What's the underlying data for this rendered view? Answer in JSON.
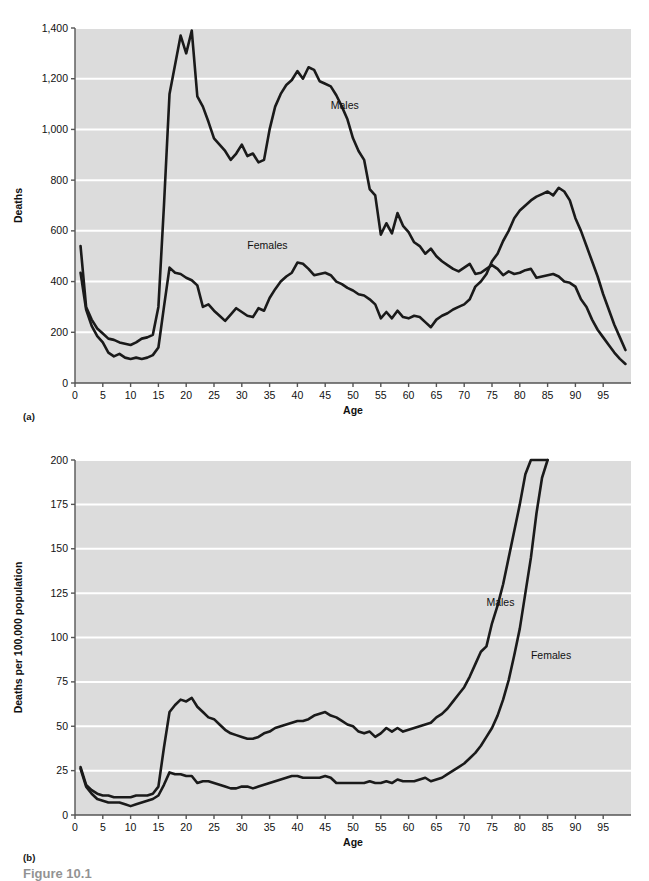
{
  "figure": {
    "caption": "Figure 10.1",
    "panel_a_tag": "(a)",
    "panel_b_tag": "(b)"
  },
  "style": {
    "plot_background": "#dcdcdc",
    "gridline_color": "#ffffff",
    "line_color": "#1a1a1a",
    "axis_color": "#555555",
    "page_background": "#ffffff"
  },
  "chart_data": [
    {
      "type": "line",
      "id": "panel-a",
      "title": "",
      "xlabel": "Age",
      "ylabel": "Deaths",
      "xlim": [
        0,
        100
      ],
      "ylim": [
        0,
        1400
      ],
      "grid": true,
      "legend_position": "inline-annotation",
      "xticks": [
        0,
        5,
        10,
        15,
        20,
        25,
        30,
        35,
        40,
        45,
        50,
        55,
        60,
        65,
        70,
        75,
        80,
        85,
        90,
        95
      ],
      "xtick_labels": [
        "0",
        "5",
        "10",
        "15",
        "20",
        "25",
        "30",
        "35",
        "40",
        "45",
        "50",
        "55",
        "60",
        "65",
        "70",
        "75",
        "80",
        "85",
        "90",
        "95"
      ],
      "yticks": [
        0,
        200,
        400,
        600,
        800,
        1000,
        1200,
        1400
      ],
      "ytick_labels": [
        "0",
        "200",
        "400",
        "600",
        "800",
        "1,000",
        "1,200",
        "1,400"
      ],
      "annotations": [
        {
          "text": "Males",
          "x": 46,
          "y": 1080
        },
        {
          "text": "Females",
          "x": 31,
          "y": 530
        }
      ],
      "x": [
        1,
        2,
        3,
        4,
        5,
        6,
        7,
        8,
        9,
        10,
        11,
        12,
        13,
        14,
        15,
        16,
        17,
        18,
        19,
        20,
        21,
        22,
        23,
        24,
        25,
        26,
        27,
        28,
        29,
        30,
        31,
        32,
        33,
        34,
        35,
        36,
        37,
        38,
        39,
        40,
        41,
        42,
        43,
        44,
        45,
        46,
        47,
        48,
        49,
        50,
        51,
        52,
        53,
        54,
        55,
        56,
        57,
        58,
        59,
        60,
        61,
        62,
        63,
        64,
        65,
        66,
        67,
        68,
        69,
        70,
        71,
        72,
        73,
        74,
        75,
        76,
        77,
        78,
        79,
        80,
        81,
        82,
        83,
        84,
        85,
        86,
        87,
        88,
        89,
        90,
        91,
        92,
        93,
        94,
        95,
        96,
        97,
        98,
        99
      ],
      "series": [
        {
          "name": "Males",
          "values": [
            540,
            300,
            250,
            215,
            195,
            175,
            170,
            160,
            155,
            150,
            160,
            175,
            180,
            190,
            300,
            700,
            1140,
            1255,
            1370,
            1300,
            1390,
            1130,
            1090,
            1030,
            965,
            940,
            915,
            880,
            905,
            940,
            895,
            905,
            870,
            880,
            1000,
            1090,
            1140,
            1175,
            1195,
            1230,
            1200,
            1245,
            1235,
            1190,
            1180,
            1170,
            1135,
            1090,
            1040,
            965,
            915,
            880,
            765,
            740,
            585,
            630,
            590,
            670,
            620,
            595,
            555,
            540,
            510,
            530,
            500,
            480,
            465,
            450,
            440,
            455,
            470,
            430,
            435,
            450,
            465,
            450,
            425,
            440,
            430,
            435,
            445,
            450,
            415,
            420,
            425,
            430,
            420,
            400,
            395,
            380,
            330,
            300,
            250,
            210,
            180,
            150,
            120,
            95,
            75,
            60
          ]
        },
        {
          "name": "Females",
          "values": [
            435,
            290,
            225,
            185,
            160,
            120,
            105,
            115,
            100,
            95,
            100,
            95,
            100,
            110,
            140,
            300,
            455,
            435,
            430,
            415,
            405,
            385,
            300,
            310,
            285,
            265,
            245,
            270,
            295,
            280,
            265,
            260,
            295,
            285,
            335,
            370,
            400,
            420,
            435,
            475,
            470,
            450,
            425,
            430,
            435,
            425,
            400,
            390,
            375,
            365,
            350,
            345,
            330,
            310,
            255,
            280,
            255,
            285,
            260,
            255,
            265,
            260,
            240,
            220,
            250,
            265,
            275,
            290,
            300,
            310,
            330,
            380,
            400,
            430,
            480,
            510,
            560,
            600,
            650,
            680,
            700,
            720,
            735,
            745,
            755,
            740,
            770,
            755,
            720,
            650,
            600,
            540,
            480,
            420,
            350,
            290,
            230,
            180,
            130
          ]
        }
      ]
    },
    {
      "type": "line",
      "id": "panel-b",
      "title": "",
      "xlabel": "Age",
      "ylabel": "Deaths per 100,000 population",
      "xlim": [
        0,
        100
      ],
      "ylim": [
        0,
        200
      ],
      "grid": true,
      "legend_position": "inline-annotation",
      "xticks": [
        0,
        5,
        10,
        15,
        20,
        25,
        30,
        35,
        40,
        45,
        50,
        55,
        60,
        65,
        70,
        75,
        80,
        85,
        90,
        95
      ],
      "xtick_labels": [
        "0",
        "5",
        "10",
        "15",
        "20",
        "25",
        "30",
        "35",
        "40",
        "45",
        "50",
        "55",
        "60",
        "65",
        "70",
        "75",
        "80",
        "85",
        "90",
        "95"
      ],
      "yticks": [
        0,
        25,
        50,
        75,
        100,
        125,
        150,
        175,
        200
      ],
      "ytick_labels": [
        "0",
        "25",
        "50",
        "75",
        "100",
        "125",
        "150",
        "175",
        "200"
      ],
      "annotations": [
        {
          "text": "Males",
          "x": 74,
          "y": 118
        },
        {
          "text": "Females",
          "x": 82,
          "y": 88
        }
      ],
      "x": [
        1,
        2,
        3,
        4,
        5,
        6,
        7,
        8,
        9,
        10,
        11,
        12,
        13,
        14,
        15,
        16,
        17,
        18,
        19,
        20,
        21,
        22,
        23,
        24,
        25,
        26,
        27,
        28,
        29,
        30,
        31,
        32,
        33,
        34,
        35,
        36,
        37,
        38,
        39,
        40,
        41,
        42,
        43,
        44,
        45,
        46,
        47,
        48,
        49,
        50,
        51,
        52,
        53,
        54,
        55,
        56,
        57,
        58,
        59,
        60,
        61,
        62,
        63,
        64,
        65,
        66,
        67,
        68,
        69,
        70,
        71,
        72,
        73,
        74,
        75,
        76,
        77,
        78,
        79,
        80,
        81,
        82,
        83,
        84,
        85
      ],
      "series": [
        {
          "name": "Males",
          "values": [
            27,
            17,
            14,
            12,
            11,
            11,
            10,
            10,
            10,
            10,
            11,
            11,
            11,
            12,
            16,
            38,
            58,
            62,
            65,
            64,
            66,
            61,
            58,
            55,
            54,
            51,
            48,
            46,
            45,
            44,
            43,
            43,
            44,
            46,
            47,
            49,
            50,
            51,
            52,
            53,
            53,
            54,
            56,
            57,
            58,
            56,
            55,
            53,
            51,
            50,
            47,
            46,
            47,
            44,
            46,
            49,
            47,
            49,
            47,
            48,
            49,
            50,
            51,
            52,
            55,
            57,
            60,
            64,
            68,
            72,
            78,
            85,
            92,
            95,
            108,
            118,
            130,
            145,
            160,
            175,
            192,
            200,
            200,
            200,
            200
          ]
        },
        {
          "name": "Females",
          "values": [
            26,
            16,
            12,
            9,
            8,
            7,
            7,
            7,
            6,
            5,
            6,
            7,
            8,
            9,
            11,
            17,
            24,
            23,
            23,
            22,
            22,
            18,
            19,
            19,
            18,
            17,
            16,
            15,
            15,
            16,
            16,
            15,
            16,
            17,
            18,
            19,
            20,
            21,
            22,
            22,
            21,
            21,
            21,
            21,
            22,
            21,
            18,
            18,
            18,
            18,
            18,
            18,
            19,
            18,
            18,
            19,
            18,
            20,
            19,
            19,
            19,
            20,
            21,
            19,
            20,
            21,
            23,
            25,
            27,
            29,
            32,
            35,
            39,
            44,
            49,
            56,
            65,
            76,
            90,
            105,
            125,
            145,
            170,
            190,
            200
          ]
        }
      ]
    }
  ]
}
